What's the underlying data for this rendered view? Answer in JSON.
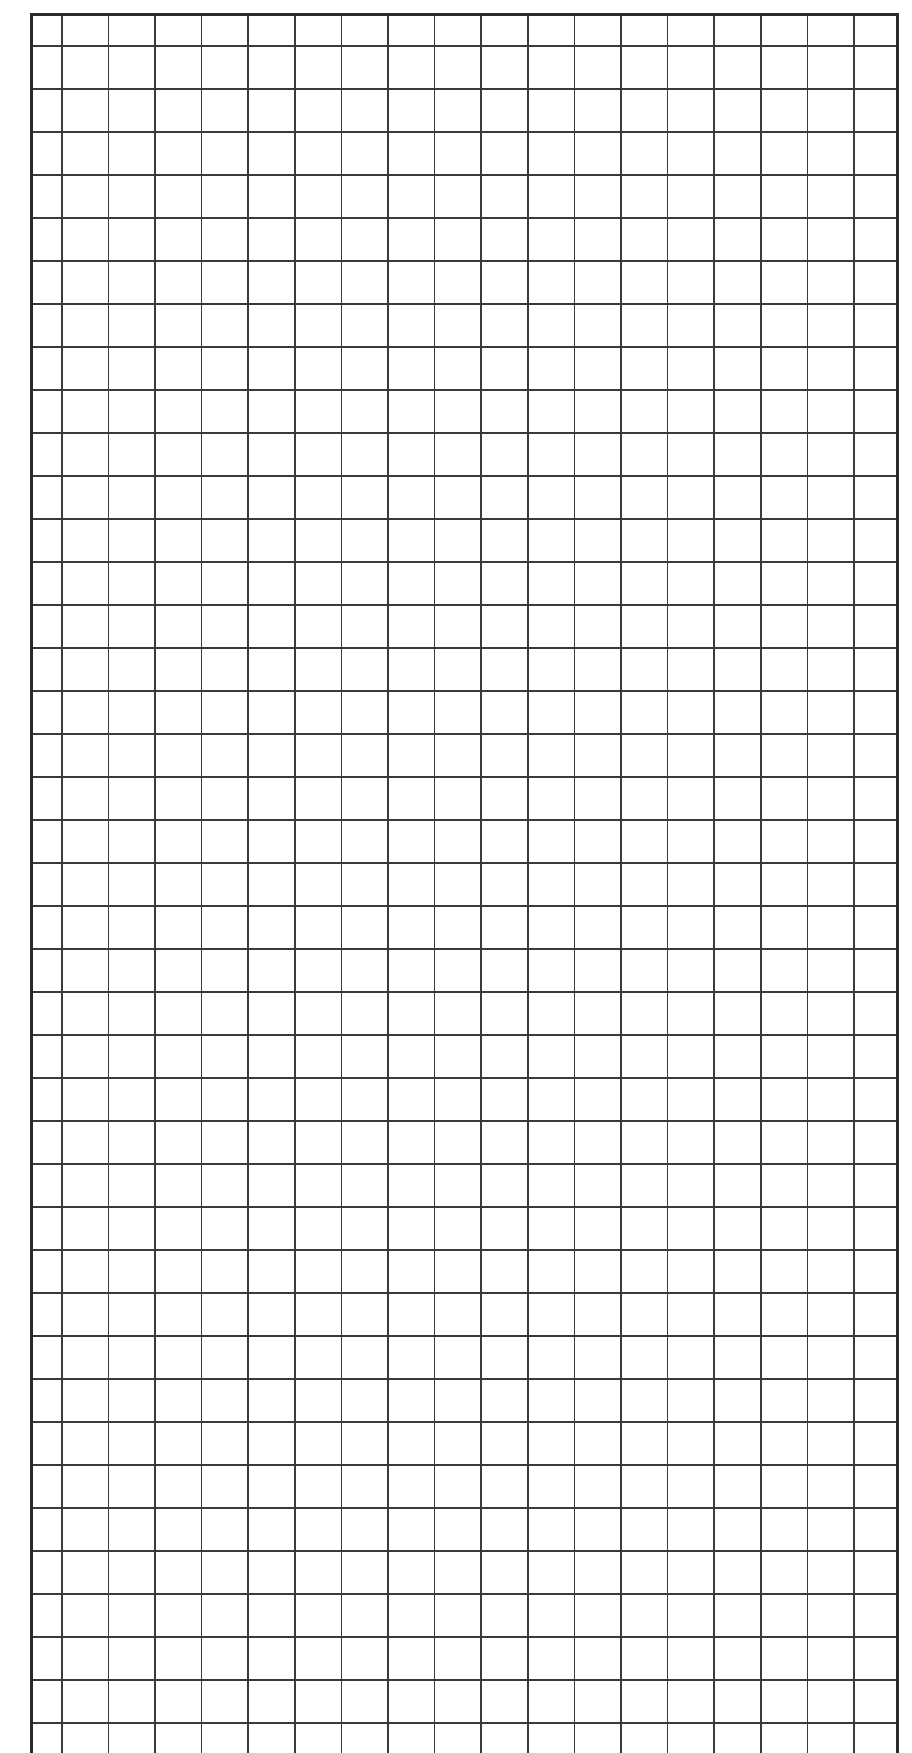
{
  "page": {
    "type": "blank grid paper",
    "background_color": "#ffffff",
    "line_color": "#3a3a3a",
    "border_color": "#2a2a2a"
  },
  "grid": {
    "columns": 19,
    "rows": 40,
    "cell_width_px": 46.6,
    "cell_height_px": 43,
    "first_col_width_px": 28,
    "first_row_height_px": 29
  }
}
